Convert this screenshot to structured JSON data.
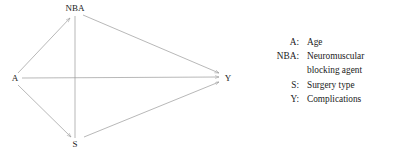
{
  "diagram": {
    "type": "causal-dag",
    "nodes": [
      {
        "id": "A",
        "label": "A",
        "x": 15,
        "y": 79
      },
      {
        "id": "NBA",
        "label": "NBA",
        "x": 75,
        "y": 11
      },
      {
        "id": "S",
        "label": "S",
        "x": 75,
        "y": 144
      },
      {
        "id": "Y",
        "label": "Y",
        "x": 226,
        "y": 78
      }
    ],
    "edges": [
      {
        "from": "A",
        "to": "NBA",
        "directed": true
      },
      {
        "from": "A",
        "to": "S",
        "directed": true
      },
      {
        "from": "A",
        "to": "Y",
        "directed": true
      },
      {
        "from": "NBA",
        "to": "S",
        "directed": true
      },
      {
        "from": "NBA",
        "to": "Y",
        "directed": true
      },
      {
        "from": "S",
        "to": "Y",
        "directed": true
      }
    ],
    "line_color": "#9a9a9a"
  },
  "legend": {
    "rows": [
      {
        "key": "A:",
        "value": "Age"
      },
      {
        "key": "NBA:",
        "value": "Neuromuscular"
      },
      {
        "key": "",
        "value": "blocking agent"
      },
      {
        "key": "S:",
        "value": "Surgery type"
      },
      {
        "key": "Y:",
        "value": "Complications"
      }
    ]
  }
}
